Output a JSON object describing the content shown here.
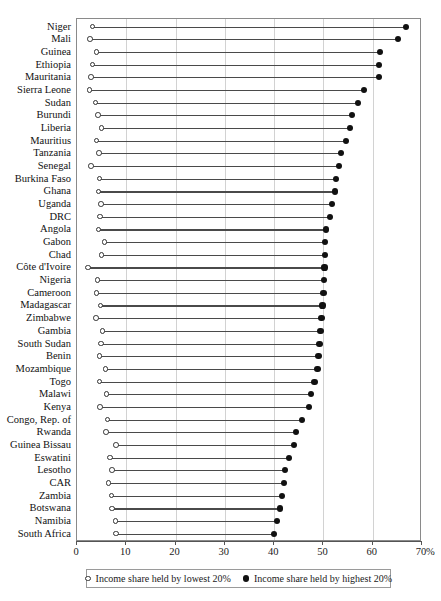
{
  "chart_data": {
    "type": "scatter",
    "title": "",
    "subtitle": "",
    "xlabel": "%",
    "ylabel": "",
    "xlim": [
      0,
      70
    ],
    "xticks": [
      0,
      10,
      20,
      30,
      40,
      50,
      60,
      70
    ],
    "xtick_labels": [
      "0",
      "10",
      "20",
      "30",
      "40",
      "50",
      "60",
      "70"
    ],
    "x_unit_suffix": "%",
    "grid": "vertical",
    "legend_position": "bottom",
    "legend": [
      {
        "marker": "open-circle",
        "label": "Income share held by lowest 20%"
      },
      {
        "marker": "filled-circle",
        "label": "Income share held by highest 20%"
      }
    ],
    "categories": [
      "Niger",
      "Mali",
      "Guinea",
      "Ethiopia",
      "Mauritania",
      "Sierra Leone",
      "Sudan",
      "Burundi",
      "Liberia",
      "Mauritius",
      "Tanzania",
      "Senegal",
      "Burkina Faso",
      "Ghana",
      "Uganda",
      "DRC",
      "Angola",
      "Gabon",
      "Chad",
      "Côte d'Ivoire",
      "Nigeria",
      "Cameroon",
      "Madagascar",
      "Zimbabwe",
      "Gambia",
      "South Sudan",
      "Benin",
      "Mozambique",
      "Togo",
      "Malawi",
      "Kenya",
      "Congo, Rep. of",
      "Rwanda",
      "Guinea Bissau",
      "Eswatini",
      "Lesotho",
      "CAR",
      "Zambia",
      "Botswana",
      "Namibia",
      "South Africa"
    ],
    "series": [
      {
        "name": "Income share held by lowest 20%",
        "marker": "open-circle",
        "values": [
          3.4,
          2.9,
          4.2,
          3.4,
          3.1,
          2.8,
          4.0,
          4.5,
          5.2,
          4.2,
          4.7,
          3.1,
          4.8,
          4.6,
          5.1,
          4.9,
          4.6,
          5.8,
          5.2,
          2.4,
          4.4,
          4.2,
          5.0,
          4.1,
          5.4,
          5.1,
          4.8,
          6.0,
          4.8,
          6.2,
          4.9,
          6.4,
          6.1,
          8.1,
          6.9,
          7.3,
          6.6,
          7.2,
          7.3,
          8.0,
          8.1
        ]
      },
      {
        "name": "Income share held by highest 20%",
        "marker": "filled-circle",
        "values": [
          66.7,
          65.1,
          61.5,
          61.3,
          61.2,
          58.2,
          57.0,
          55.8,
          55.4,
          54.6,
          53.6,
          53.2,
          52.6,
          52.3,
          51.8,
          51.4,
          50.6,
          50.4,
          50.3,
          50.2,
          50.1,
          50.0,
          49.8,
          49.6,
          49.4,
          49.2,
          49.0,
          48.8,
          48.2,
          47.4,
          47.0,
          45.6,
          44.4,
          44.0,
          43.0,
          42.2,
          42.0,
          41.6,
          41.2,
          40.6,
          40.0
        ]
      }
    ]
  }
}
